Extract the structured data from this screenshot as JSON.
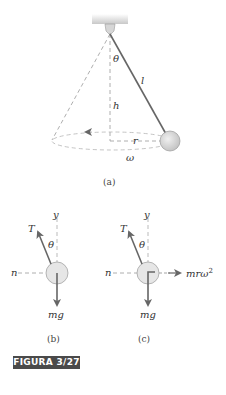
{
  "figure": {
    "label": "FIGURA 3/27",
    "label_bg_color": "#4a4a4a",
    "line_color": "#666666",
    "dash_color": "#aaaaaa",
    "bob_fill": "#d8d8d8"
  },
  "diagram_a": {
    "caption": "(a)",
    "labels": {
      "theta": "θ",
      "length": "l",
      "height": "h",
      "radius": "r",
      "omega": "ω"
    }
  },
  "diagram_b": {
    "caption": "(b)",
    "labels": {
      "tension": "T",
      "y_axis": "y",
      "theta": "θ",
      "n_axis": "n",
      "weight": "mg"
    }
  },
  "diagram_c": {
    "caption": "(c)",
    "labels": {
      "tension": "T",
      "y_axis": "y",
      "theta": "θ",
      "n_axis": "n",
      "weight": "mg",
      "centripetal": "mrω",
      "centripetal_exp": "2"
    }
  }
}
